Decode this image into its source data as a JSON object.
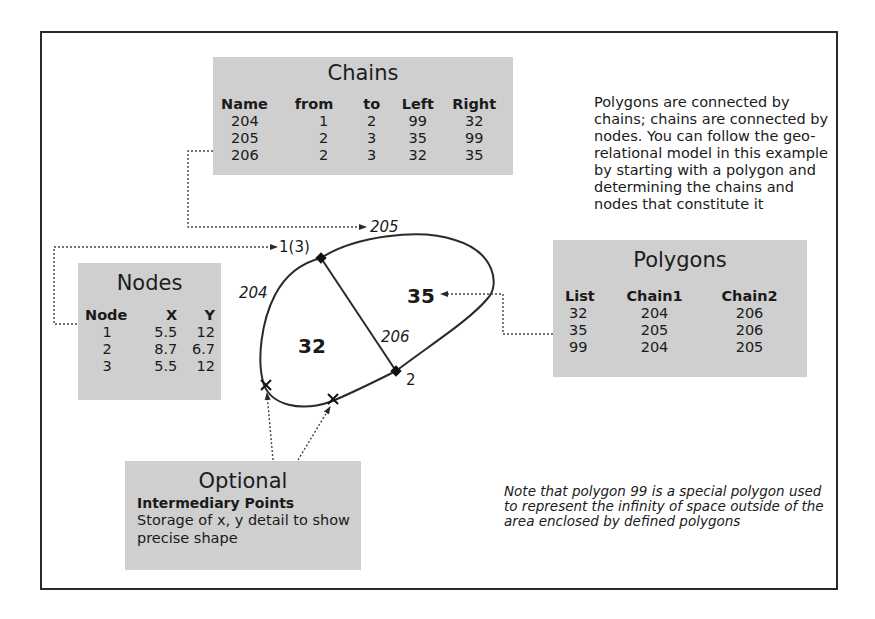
{
  "chains": {
    "title": "Chains",
    "columns": [
      "Name",
      "from",
      "to",
      "Left",
      "Right"
    ],
    "rows": [
      [
        "204",
        "1",
        "2",
        "99",
        "32"
      ],
      [
        "205",
        "2",
        "3",
        "35",
        "99"
      ],
      [
        "206",
        "2",
        "3",
        "32",
        "35"
      ]
    ]
  },
  "nodes": {
    "title": "Nodes",
    "columns": [
      "Node",
      "X",
      "Y"
    ],
    "rows": [
      [
        "1",
        "5.5",
        "12"
      ],
      [
        "2",
        "8.7",
        "6.7"
      ],
      [
        "3",
        "5.5",
        "12"
      ]
    ]
  },
  "polygons": {
    "title": "Polygons",
    "columns": [
      "List",
      "Chain1",
      "Chain2"
    ],
    "rows": [
      [
        "32",
        "204",
        "206"
      ],
      [
        "35",
        "205",
        "206"
      ],
      [
        "99",
        "204",
        "205"
      ]
    ]
  },
  "optional": {
    "title": "Optional",
    "subtitle": "Intermediary Points",
    "description": "Storage of x, y detail to show precise shape"
  },
  "description": "Polygons are connected by chains; chains are connected by nodes. You can follow the geo-relational model in this example by starting with a polygon and determining the chains and nodes that constitute it",
  "note": "Note that polygon 99 is a special polygon used to represent the infinity of space outside of the area enclosed by defined polygons",
  "diagram": {
    "chain_labels": {
      "c204": "204",
      "c205": "205",
      "c206": "206"
    },
    "node_labels": {
      "n1": "1(3)",
      "n2": "2"
    },
    "polygon_labels": {
      "p32": "32",
      "p35": "35"
    }
  },
  "colors": {
    "box_fill": "#cfcfcf",
    "line": "#2a2a2a",
    "text": "#1a1a1a"
  }
}
